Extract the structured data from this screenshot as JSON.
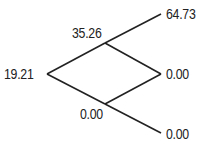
{
  "diagram": {
    "type": "binomial-tree",
    "line_color": "#222222",
    "nodes": {
      "root": {
        "label": "19.21"
      },
      "up": {
        "label": "35.26"
      },
      "down": {
        "label": "0.00"
      },
      "up_up": {
        "label": "64.73"
      },
      "up_down": {
        "label": "0.00"
      },
      "down_down": {
        "label": "0.00"
      }
    }
  }
}
